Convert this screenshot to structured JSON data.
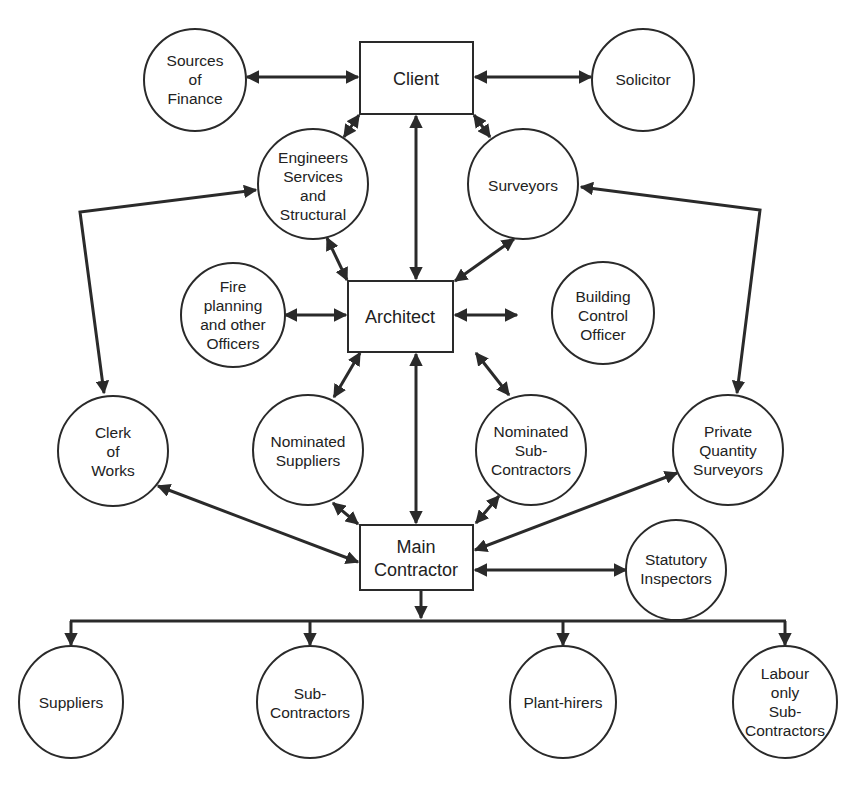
{
  "diagram": {
    "type": "organisational-relationship-diagram",
    "boxes": {
      "client": {
        "label": [
          "Client"
        ]
      },
      "architect": {
        "label": [
          "Architect"
        ]
      },
      "main_contractor": {
        "label": [
          "Main",
          "Contractor"
        ]
      }
    },
    "circles": {
      "sources_of_finance": {
        "label": [
          "Sources",
          "of",
          "Finance"
        ]
      },
      "solicitor": {
        "label": [
          "Solicitor"
        ]
      },
      "engineers": {
        "label": [
          "Engineers",
          "Services",
          "and",
          "Structural"
        ]
      },
      "surveyors": {
        "label": [
          "Surveyors"
        ]
      },
      "fire_planning": {
        "label": [
          "Fire",
          "planning",
          "and other",
          "Officers"
        ]
      },
      "building_control": {
        "label": [
          "Building",
          "Control",
          "Officer"
        ]
      },
      "clerk_of_works": {
        "label": [
          "Clerk",
          "of",
          "Works"
        ]
      },
      "nominated_suppliers": {
        "label": [
          "Nominated",
          "Suppliers"
        ]
      },
      "nominated_subcontractors": {
        "label": [
          "Nominated",
          "Sub-",
          "Contractors"
        ]
      },
      "private_qs": {
        "label": [
          "Private",
          "Quantity",
          "Surveyors"
        ]
      },
      "statutory_inspectors": {
        "label": [
          "Statutory",
          "Inspectors"
        ]
      }
    },
    "ellipses": {
      "suppliers": {
        "label": [
          "Suppliers"
        ]
      },
      "sub_contractors": {
        "label": [
          "Sub-",
          "Contractors"
        ]
      },
      "plant_hirers": {
        "label": [
          "Plant-hirers"
        ]
      },
      "labour_only": {
        "label": [
          "Labour",
          "only",
          "Sub-",
          "Contractors"
        ]
      }
    },
    "connections": [
      {
        "from": "Sources of Finance",
        "to": "Client",
        "type": "two-way"
      },
      {
        "from": "Client",
        "to": "Solicitor",
        "type": "two-way"
      },
      {
        "from": "Client",
        "to": "Engineers Services and Structural",
        "type": "two-way"
      },
      {
        "from": "Client",
        "to": "Surveyors",
        "type": "two-way"
      },
      {
        "from": "Client",
        "to": "Architect",
        "type": "two-way"
      },
      {
        "from": "Engineers Services and Structural",
        "to": "Architect",
        "type": "two-way"
      },
      {
        "from": "Surveyors",
        "to": "Architect",
        "type": "two-way"
      },
      {
        "from": "Fire planning and other Officers",
        "to": "Architect",
        "type": "two-way"
      },
      {
        "from": "Architect",
        "to": "Building Control Officer",
        "type": "two-way"
      },
      {
        "from": "Architect",
        "to": "Nominated Suppliers",
        "type": "two-way"
      },
      {
        "from": "Architect",
        "to": "Nominated Sub-Contractors",
        "type": "two-way"
      },
      {
        "from": "Architect",
        "to": "Main Contractor",
        "type": "two-way"
      },
      {
        "from": "Engineers Services and Structural",
        "to": "Clerk of Works",
        "type": "two-way"
      },
      {
        "from": "Surveyors",
        "to": "Private Quantity Surveyors",
        "type": "two-way"
      },
      {
        "from": "Clerk of Works",
        "to": "Main Contractor",
        "type": "two-way"
      },
      {
        "from": "Nominated Suppliers",
        "to": "Main Contractor",
        "type": "two-way"
      },
      {
        "from": "Nominated Sub-Contractors",
        "to": "Main Contractor",
        "type": "two-way"
      },
      {
        "from": "Private Quantity Surveyors",
        "to": "Main Contractor",
        "type": "two-way"
      },
      {
        "from": "Main Contractor",
        "to": "Statutory Inspectors",
        "type": "two-way"
      },
      {
        "from": "Main Contractor",
        "to": "Suppliers",
        "type": "one-way"
      },
      {
        "from": "Main Contractor",
        "to": "Sub-Contractors",
        "type": "one-way"
      },
      {
        "from": "Main Contractor",
        "to": "Plant-hirers",
        "type": "one-way"
      },
      {
        "from": "Main Contractor",
        "to": "Labour only Sub-Contractors",
        "type": "one-way"
      }
    ],
    "colors": {
      "ink": "#2a2a2a",
      "background": "#ffffff"
    }
  }
}
